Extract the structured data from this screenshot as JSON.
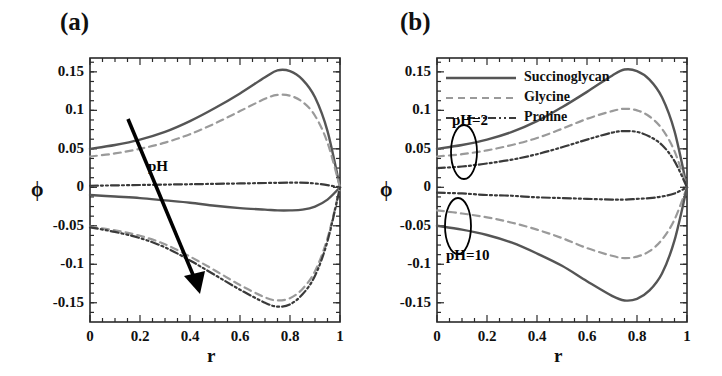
{
  "figure": {
    "panels": [
      {
        "id": "a",
        "label": "(a)",
        "xlabel": "r",
        "ylabel": "ϕ",
        "annotation": "pH"
      },
      {
        "id": "b",
        "label": "(b)",
        "xlabel": "r",
        "ylabel": "ϕ",
        "annotation_high": "pH=2",
        "annotation_low": "pH=10"
      }
    ],
    "legend": {
      "items": [
        {
          "label": "Succinoglycan",
          "style": "solid",
          "color": "#555555"
        },
        {
          "label": "Glycine",
          "style": "dashed",
          "color": "#9a9a9a"
        },
        {
          "label": "Proline",
          "style": "dashdot",
          "color": "#3a3a3a"
        }
      ]
    },
    "ticks": {
      "x": [
        "0",
        "0.2",
        "0.4",
        "0.6",
        "0.8",
        "1"
      ],
      "y": [
        "0.15",
        "0.1",
        "0.05",
        "0",
        "-0.05",
        "-0.1",
        "-0.15"
      ]
    },
    "colors": {
      "solid": "#555555",
      "dashed": "#9a9a9a",
      "dashdot": "#3a3a3a",
      "frame": "#2a2a2a",
      "arrow": "#000000"
    }
  },
  "chart_data": {
    "type": "line",
    "title": "",
    "xlabel": "r",
    "ylabel": "ϕ",
    "xlim": [
      0,
      1
    ],
    "ylim": [
      -0.175,
      0.168
    ],
    "xticks": [
      0,
      0.2,
      0.4,
      0.6,
      0.8,
      1
    ],
    "yticks": [
      0.15,
      0.1,
      0.05,
      0,
      -0.05,
      -0.1,
      -0.15
    ],
    "grid": false,
    "legend_position": "upper-left-of-panel-b",
    "panels": [
      {
        "panel": "a",
        "annotations": [
          {
            "text": "pH",
            "note": "arrow pointing down-right indicating increasing pH"
          }
        ],
        "series": [
          {
            "name": "Succinoglycan pH=2",
            "style": "solid",
            "color": "#555555",
            "x": [
              0,
              0.1,
              0.2,
              0.3,
              0.4,
              0.5,
              0.6,
              0.7,
              0.75,
              0.8,
              0.85,
              0.9,
              0.95,
              1
            ],
            "y": [
              0.05,
              0.055,
              0.062,
              0.072,
              0.086,
              0.103,
              0.122,
              0.143,
              0.152,
              0.151,
              0.14,
              0.117,
              0.073,
              0.0
            ]
          },
          {
            "name": "Glycine pH=2",
            "style": "dashed",
            "color": "#9a9a9a",
            "x": [
              0,
              0.1,
              0.2,
              0.3,
              0.4,
              0.5,
              0.6,
              0.7,
              0.75,
              0.8,
              0.85,
              0.9,
              0.95,
              1
            ],
            "y": [
              0.04,
              0.044,
              0.05,
              0.058,
              0.069,
              0.083,
              0.099,
              0.115,
              0.12,
              0.119,
              0.111,
              0.093,
              0.058,
              0.0
            ]
          },
          {
            "name": "Proline pH=2",
            "style": "dashdot",
            "color": "#3a3a3a",
            "x": [
              0,
              0.2,
              0.4,
              0.6,
              0.8,
              0.9,
              1
            ],
            "y": [
              0.002,
              0.003,
              0.004,
              0.005,
              0.006,
              0.005,
              0.0
            ]
          },
          {
            "name": "Succinoglycan pH=10",
            "style": "solid",
            "color": "#555555",
            "x": [
              0,
              0.1,
              0.2,
              0.3,
              0.4,
              0.5,
              0.6,
              0.7,
              0.75,
              0.8,
              0.85,
              0.9,
              0.95,
              1
            ],
            "y": [
              -0.01,
              -0.012,
              -0.014,
              -0.017,
              -0.02,
              -0.024,
              -0.027,
              -0.029,
              -0.03,
              -0.03,
              -0.029,
              -0.025,
              -0.016,
              0.0
            ]
          },
          {
            "name": "Glycine pH=10",
            "style": "dashed",
            "color": "#9a9a9a",
            "x": [
              0,
              0.1,
              0.2,
              0.3,
              0.4,
              0.5,
              0.6,
              0.7,
              0.75,
              0.8,
              0.85,
              0.9,
              0.95,
              1
            ],
            "y": [
              -0.051,
              -0.056,
              -0.063,
              -0.074,
              -0.09,
              -0.108,
              -0.127,
              -0.143,
              -0.147,
              -0.144,
              -0.132,
              -0.109,
              -0.066,
              0.0
            ]
          },
          {
            "name": "Proline pH=10",
            "style": "dashdot",
            "color": "#3a3a3a",
            "x": [
              0,
              0.1,
              0.2,
              0.3,
              0.4,
              0.5,
              0.6,
              0.7,
              0.75,
              0.8,
              0.85,
              0.9,
              0.95,
              1
            ],
            "y": [
              -0.052,
              -0.058,
              -0.066,
              -0.078,
              -0.095,
              -0.114,
              -0.133,
              -0.15,
              -0.155,
              -0.152,
              -0.139,
              -0.115,
              -0.07,
              0.0
            ]
          }
        ]
      },
      {
        "panel": "b",
        "annotations": [
          {
            "text": "pH=2",
            "note": "ellipse around upper bundle of curves near r=0.1"
          },
          {
            "text": "pH=10",
            "note": "ellipse around lower bundle of curves near r=0.08"
          }
        ],
        "series": [
          {
            "name": "Succinoglycan pH=2",
            "style": "solid",
            "color": "#555555",
            "x": [
              0,
              0.1,
              0.2,
              0.3,
              0.4,
              0.5,
              0.6,
              0.7,
              0.75,
              0.8,
              0.85,
              0.9,
              0.95,
              1
            ],
            "y": [
              0.05,
              0.055,
              0.062,
              0.072,
              0.086,
              0.104,
              0.124,
              0.145,
              0.153,
              0.151,
              0.14,
              0.117,
              0.073,
              0.0
            ]
          },
          {
            "name": "Glycine pH=2",
            "style": "dashed",
            "color": "#9a9a9a",
            "x": [
              0,
              0.1,
              0.2,
              0.3,
              0.4,
              0.5,
              0.6,
              0.7,
              0.75,
              0.8,
              0.85,
              0.9,
              0.95,
              1
            ],
            "y": [
              0.04,
              0.043,
              0.048,
              0.055,
              0.064,
              0.076,
              0.089,
              0.099,
              0.102,
              0.1,
              0.092,
              0.076,
              0.047,
              0.0
            ]
          },
          {
            "name": "Proline pH=2",
            "style": "dashdot",
            "color": "#3a3a3a",
            "x": [
              0,
              0.1,
              0.2,
              0.3,
              0.4,
              0.5,
              0.6,
              0.7,
              0.75,
              0.8,
              0.85,
              0.9,
              0.95,
              1
            ],
            "y": [
              0.025,
              0.027,
              0.031,
              0.036,
              0.043,
              0.052,
              0.062,
              0.071,
              0.073,
              0.072,
              0.066,
              0.055,
              0.034,
              0.0
            ]
          },
          {
            "name": "Proline pH=10",
            "style": "dashdot",
            "color": "#3a3a3a",
            "x": [
              0,
              0.1,
              0.2,
              0.3,
              0.4,
              0.5,
              0.6,
              0.7,
              0.75,
              0.8,
              0.85,
              0.9,
              0.95,
              1
            ],
            "y": [
              -0.007,
              -0.008,
              -0.01,
              -0.011,
              -0.013,
              -0.014,
              -0.015,
              -0.016,
              -0.016,
              -0.015,
              -0.014,
              -0.012,
              -0.008,
              0.0
            ]
          },
          {
            "name": "Glycine pH=10",
            "style": "dashed",
            "color": "#9a9a9a",
            "x": [
              0,
              0.1,
              0.2,
              0.3,
              0.4,
              0.5,
              0.6,
              0.7,
              0.75,
              0.8,
              0.85,
              0.9,
              0.95,
              1
            ],
            "y": [
              -0.03,
              -0.034,
              -0.039,
              -0.046,
              -0.055,
              -0.066,
              -0.079,
              -0.089,
              -0.092,
              -0.09,
              -0.083,
              -0.068,
              -0.042,
              0.0
            ]
          },
          {
            "name": "Succinoglycan pH=10",
            "style": "solid",
            "color": "#555555",
            "x": [
              0,
              0.1,
              0.2,
              0.3,
              0.4,
              0.5,
              0.6,
              0.7,
              0.75,
              0.8,
              0.85,
              0.9,
              0.95,
              1
            ],
            "y": [
              -0.05,
              -0.055,
              -0.062,
              -0.072,
              -0.086,
              -0.102,
              -0.122,
              -0.141,
              -0.147,
              -0.145,
              -0.134,
              -0.112,
              -0.069,
              0.0
            ]
          }
        ]
      }
    ]
  }
}
